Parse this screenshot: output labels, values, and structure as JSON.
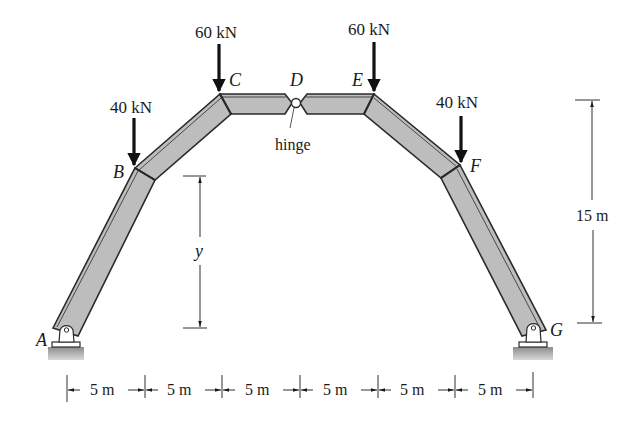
{
  "diagram": {
    "colors": {
      "member_fill": "#b9b9b9",
      "member_edge": "#2a2a2a",
      "ground_fill": "#9a9a9a",
      "text": "#1a1a1a"
    },
    "nodes": [
      {
        "id": "A",
        "label": "A"
      },
      {
        "id": "B",
        "label": "B"
      },
      {
        "id": "C",
        "label": "C"
      },
      {
        "id": "D",
        "label": "D"
      },
      {
        "id": "E",
        "label": "E"
      },
      {
        "id": "F",
        "label": "F"
      },
      {
        "id": "G",
        "label": "G"
      }
    ],
    "loads": [
      {
        "at": "B",
        "label": "40 kN",
        "direction": "down"
      },
      {
        "at": "C",
        "label": "60 kN",
        "direction": "down"
      },
      {
        "at": "E",
        "label": "60 kN",
        "direction": "down"
      },
      {
        "at": "F",
        "label": "40 kN",
        "direction": "down"
      }
    ],
    "hinge_label": "hinge",
    "supports": [
      {
        "at": "A",
        "type": "pin"
      },
      {
        "at": "G",
        "type": "pin"
      }
    ],
    "dimensions": {
      "horizontal_spans": [
        "5 m",
        "5 m",
        "5 m",
        "5 m",
        "5 m",
        "5 m"
      ],
      "total_height": "15 m",
      "unknown_height": "y"
    }
  }
}
